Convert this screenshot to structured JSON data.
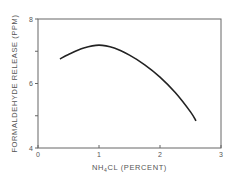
{
  "chart_data": {
    "type": "line",
    "title": "",
    "xlabel": "NH4CL (PERCENT)",
    "xlabel_main": "NH",
    "xlabel_sub": "4",
    "xlabel_rest": "CL (PERCENT)",
    "ylabel": "FORMALDEHYDE RELEASE (PPM)",
    "xlim": [
      0,
      3
    ],
    "ylim": [
      4,
      8
    ],
    "x_ticks": [
      0,
      1,
      2,
      3
    ],
    "x_tick_labels": [
      "0",
      "1",
      "2",
      "3"
    ],
    "y_ticks": [
      4,
      5,
      6,
      7,
      8
    ],
    "y_tick_labels": [
      "4",
      "",
      "6",
      "",
      "8"
    ],
    "grid": false,
    "legend": null,
    "series": [
      {
        "name": "Formaldehyde release",
        "color": "#222222",
        "x": [
          0.36,
          0.5,
          0.75,
          1.0,
          1.25,
          1.5,
          1.75,
          2.0,
          2.25,
          2.5,
          2.59
        ],
        "values": [
          6.76,
          6.9,
          7.1,
          7.19,
          7.1,
          6.88,
          6.58,
          6.2,
          5.72,
          5.12,
          4.84
        ]
      }
    ]
  },
  "colors": {
    "axis": "#666666",
    "curve": "#222222",
    "text": "#555555"
  }
}
